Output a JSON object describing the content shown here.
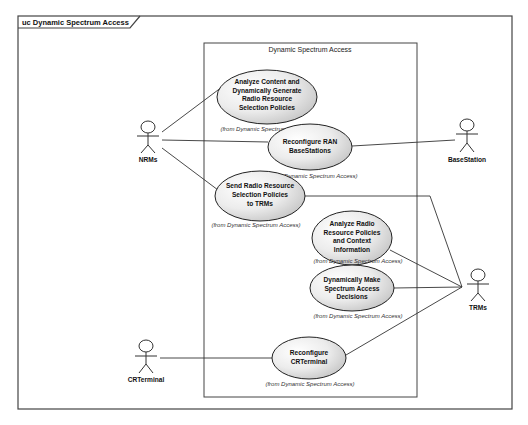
{
  "diagram": {
    "type": "uml-use-case",
    "frame_title": "uc Dynamic Spectrum Access",
    "boundary_title": "Dynamic Spectrum Access",
    "colors": {
      "ellipse_fill_light": "#ffffff",
      "ellipse_fill_dark": "#c8c8c8",
      "line": "#333333",
      "frame": "#444444"
    },
    "actors": [
      {
        "id": "nrms",
        "label": "NRMs"
      },
      {
        "id": "basestation",
        "label": "BaseStation"
      },
      {
        "id": "trms",
        "label": "TRMs"
      },
      {
        "id": "crterminal",
        "label": "CRTerminal"
      }
    ],
    "use_cases": [
      {
        "id": "uc1",
        "lines": [
          "Analyze Content and",
          "Dynamically Generate",
          "Radio Resource",
          "Selection Policies"
        ],
        "note": "(from Dynamic Spectrum Access)"
      },
      {
        "id": "uc2",
        "lines": [
          "Reconfigure RAN",
          "BaseStations"
        ],
        "note": "(from Dynamic Spectrum Access)"
      },
      {
        "id": "uc3",
        "lines": [
          "Send Radio Resource",
          "Selection Policies",
          "to TRMs"
        ],
        "note": "(from Dynamic Spectrum Access)"
      },
      {
        "id": "uc4",
        "lines": [
          "Analyze Radio",
          "Resource Policies",
          "and Context",
          "Information"
        ],
        "note": "(from Dynamic Spectrum Access)"
      },
      {
        "id": "uc5",
        "lines": [
          "Dynamically Make",
          "Spectrum Access",
          "Decisions"
        ],
        "note": "(from Dynamic Spectrum Access)"
      },
      {
        "id": "uc6",
        "lines": [
          "Reconfigure",
          "CRTerminal"
        ],
        "note": "(from Dynamic Spectrum Access)"
      }
    ],
    "associations": [
      {
        "from": "nrms",
        "to": "uc1"
      },
      {
        "from": "nrms",
        "to": "uc2"
      },
      {
        "from": "nrms",
        "to": "uc3"
      },
      {
        "from": "uc2",
        "to": "basestation"
      },
      {
        "from": "uc3",
        "to": "trms"
      },
      {
        "from": "uc4",
        "to": "trms"
      },
      {
        "from": "uc5",
        "to": "trms"
      },
      {
        "from": "uc6",
        "to": "trms"
      },
      {
        "from": "crterminal",
        "to": "uc6"
      }
    ]
  }
}
